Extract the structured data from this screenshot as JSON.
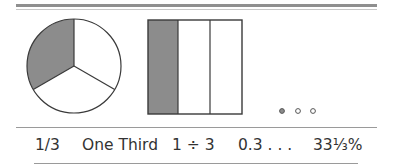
{
  "figure": {
    "colors": {
      "shade": "#8c8c8c",
      "stroke": "#3a3a3a",
      "rule": "#8f8f8f",
      "text": "#333333"
    },
    "pie": {
      "parts": 3,
      "shaded": 1
    },
    "bar": {
      "parts": 3,
      "shaded": 1
    },
    "dots": {
      "count": 3,
      "filled": 1
    }
  },
  "labels": {
    "fraction": "1/3",
    "words": "One Third",
    "division": "1 ÷ 3",
    "decimal": "0.3 . . .",
    "percent": "33⅓%"
  }
}
